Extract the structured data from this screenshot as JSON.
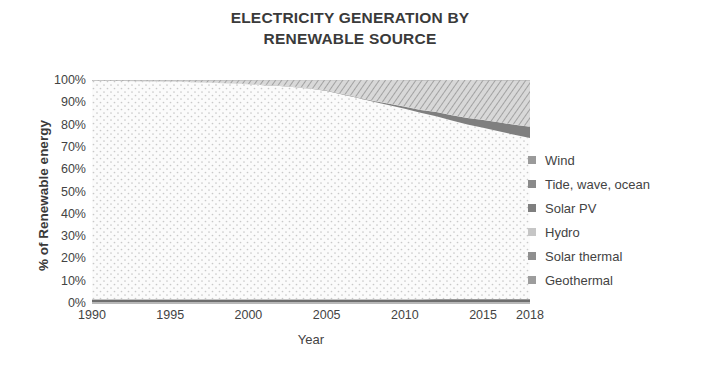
{
  "chart_data": {
    "type": "area",
    "stacked": true,
    "title": "ELECTRICITY GENERATION BY RENEWABLE SOURCE",
    "title_line1": "ELECTRICITY GENERATION BY",
    "title_line2": "RENEWABLE SOURCE",
    "xlabel": "Year",
    "ylabel": "% of Renewable energy",
    "xlim": [
      1990,
      2018
    ],
    "ylim": [
      0,
      100
    ],
    "grid": false,
    "legend_position": "right",
    "x_tick_labels": [
      "1990",
      "1995",
      "2000",
      "2005",
      "2010",
      "2015",
      "2018"
    ],
    "x_ticks": [
      1990,
      1995,
      2000,
      2005,
      2010,
      2015,
      2018
    ],
    "y_tick_labels": [
      "100%",
      "90%",
      "80%",
      "70%",
      "60%",
      "50%",
      "40%",
      "30%",
      "20%",
      "10%",
      "0%"
    ],
    "y_ticks": [
      100,
      90,
      80,
      70,
      60,
      50,
      40,
      30,
      20,
      10,
      0
    ],
    "x": [
      1990,
      1991,
      1992,
      1993,
      1994,
      1995,
      1996,
      1997,
      1998,
      1999,
      2000,
      2001,
      2002,
      2003,
      2004,
      2005,
      2006,
      2007,
      2008,
      2009,
      2010,
      2011,
      2012,
      2013,
      2014,
      2015,
      2016,
      2017,
      2018
    ],
    "series": [
      {
        "name": "Geothermal",
        "fill": "#6e6e6e",
        "pattern": "solid",
        "values": [
          1.4,
          1.4,
          1.4,
          1.4,
          1.4,
          1.4,
          1.4,
          1.4,
          1.4,
          1.4,
          1.4,
          1.4,
          1.4,
          1.4,
          1.4,
          1.4,
          1.4,
          1.4,
          1.4,
          1.4,
          1.4,
          1.4,
          1.4,
          1.4,
          1.4,
          1.4,
          1.4,
          1.4,
          1.4
        ]
      },
      {
        "name": "Solar thermal",
        "fill": "#9a9a9a",
        "pattern": "solid",
        "values": [
          0.3,
          0.3,
          0.3,
          0.3,
          0.3,
          0.3,
          0.3,
          0.3,
          0.3,
          0.3,
          0.3,
          0.3,
          0.3,
          0.3,
          0.3,
          0.3,
          0.3,
          0.3,
          0.3,
          0.3,
          0.3,
          0.3,
          0.4,
          0.4,
          0.4,
          0.4,
          0.4,
          0.4,
          0.4
        ]
      },
      {
        "name": "Hydro",
        "fill": "#f2f2f2",
        "pattern": "dots",
        "values": [
          98.0,
          97.9,
          97.8,
          97.7,
          97.6,
          97.5,
          97.4,
          97.2,
          97.0,
          96.7,
          96.4,
          96.0,
          95.6,
          95.1,
          94.4,
          93.4,
          91.8,
          90.2,
          88.5,
          87.0,
          85.4,
          83.6,
          82.0,
          80.0,
          78.2,
          76.8,
          75.2,
          73.6,
          72.2
        ]
      },
      {
        "name": "Solar PV",
        "fill": "#7f7f7f",
        "pattern": "solid",
        "values": [
          0.0,
          0.0,
          0.0,
          0.0,
          0.0,
          0.0,
          0.0,
          0.0,
          0.0,
          0.0,
          0.0,
          0.1,
          0.1,
          0.1,
          0.1,
          0.2,
          0.2,
          0.3,
          0.4,
          0.6,
          0.9,
          1.3,
          1.9,
          2.4,
          3.0,
          3.5,
          4.0,
          4.5,
          5.0
        ]
      },
      {
        "name": "Tide, wave, ocean",
        "fill": "#b5b5b5",
        "pattern": "solid",
        "values": [
          0.1,
          0.1,
          0.1,
          0.1,
          0.1,
          0.1,
          0.1,
          0.1,
          0.1,
          0.1,
          0.1,
          0.1,
          0.1,
          0.1,
          0.1,
          0.1,
          0.1,
          0.1,
          0.1,
          0.1,
          0.1,
          0.1,
          0.1,
          0.1,
          0.1,
          0.1,
          0.1,
          0.1,
          0.1
        ]
      },
      {
        "name": "Wind",
        "fill": "#bdbdbd",
        "pattern": "hatch",
        "values": [
          0.2,
          0.3,
          0.4,
          0.5,
          0.6,
          0.7,
          0.8,
          1.0,
          1.2,
          1.5,
          1.8,
          2.2,
          2.6,
          3.1,
          3.8,
          4.7,
          6.3,
          8.0,
          9.7,
          10.9,
          12.0,
          13.3,
          14.2,
          16.1,
          17.3,
          17.8,
          18.9,
          20.0,
          20.9
        ]
      }
    ],
    "legend": [
      {
        "label": "Wind",
        "color": "#9a9a9a"
      },
      {
        "label": "Tide, wave, ocean",
        "color": "#8a8a8a"
      },
      {
        "label": "Solar PV",
        "color": "#7f7f7f"
      },
      {
        "label": "Hydro",
        "color": "#c6c6c6"
      },
      {
        "label": "Solar thermal",
        "color": "#8f8f8f"
      },
      {
        "label": "Geothermal",
        "color": "#9d9d9d"
      }
    ]
  }
}
